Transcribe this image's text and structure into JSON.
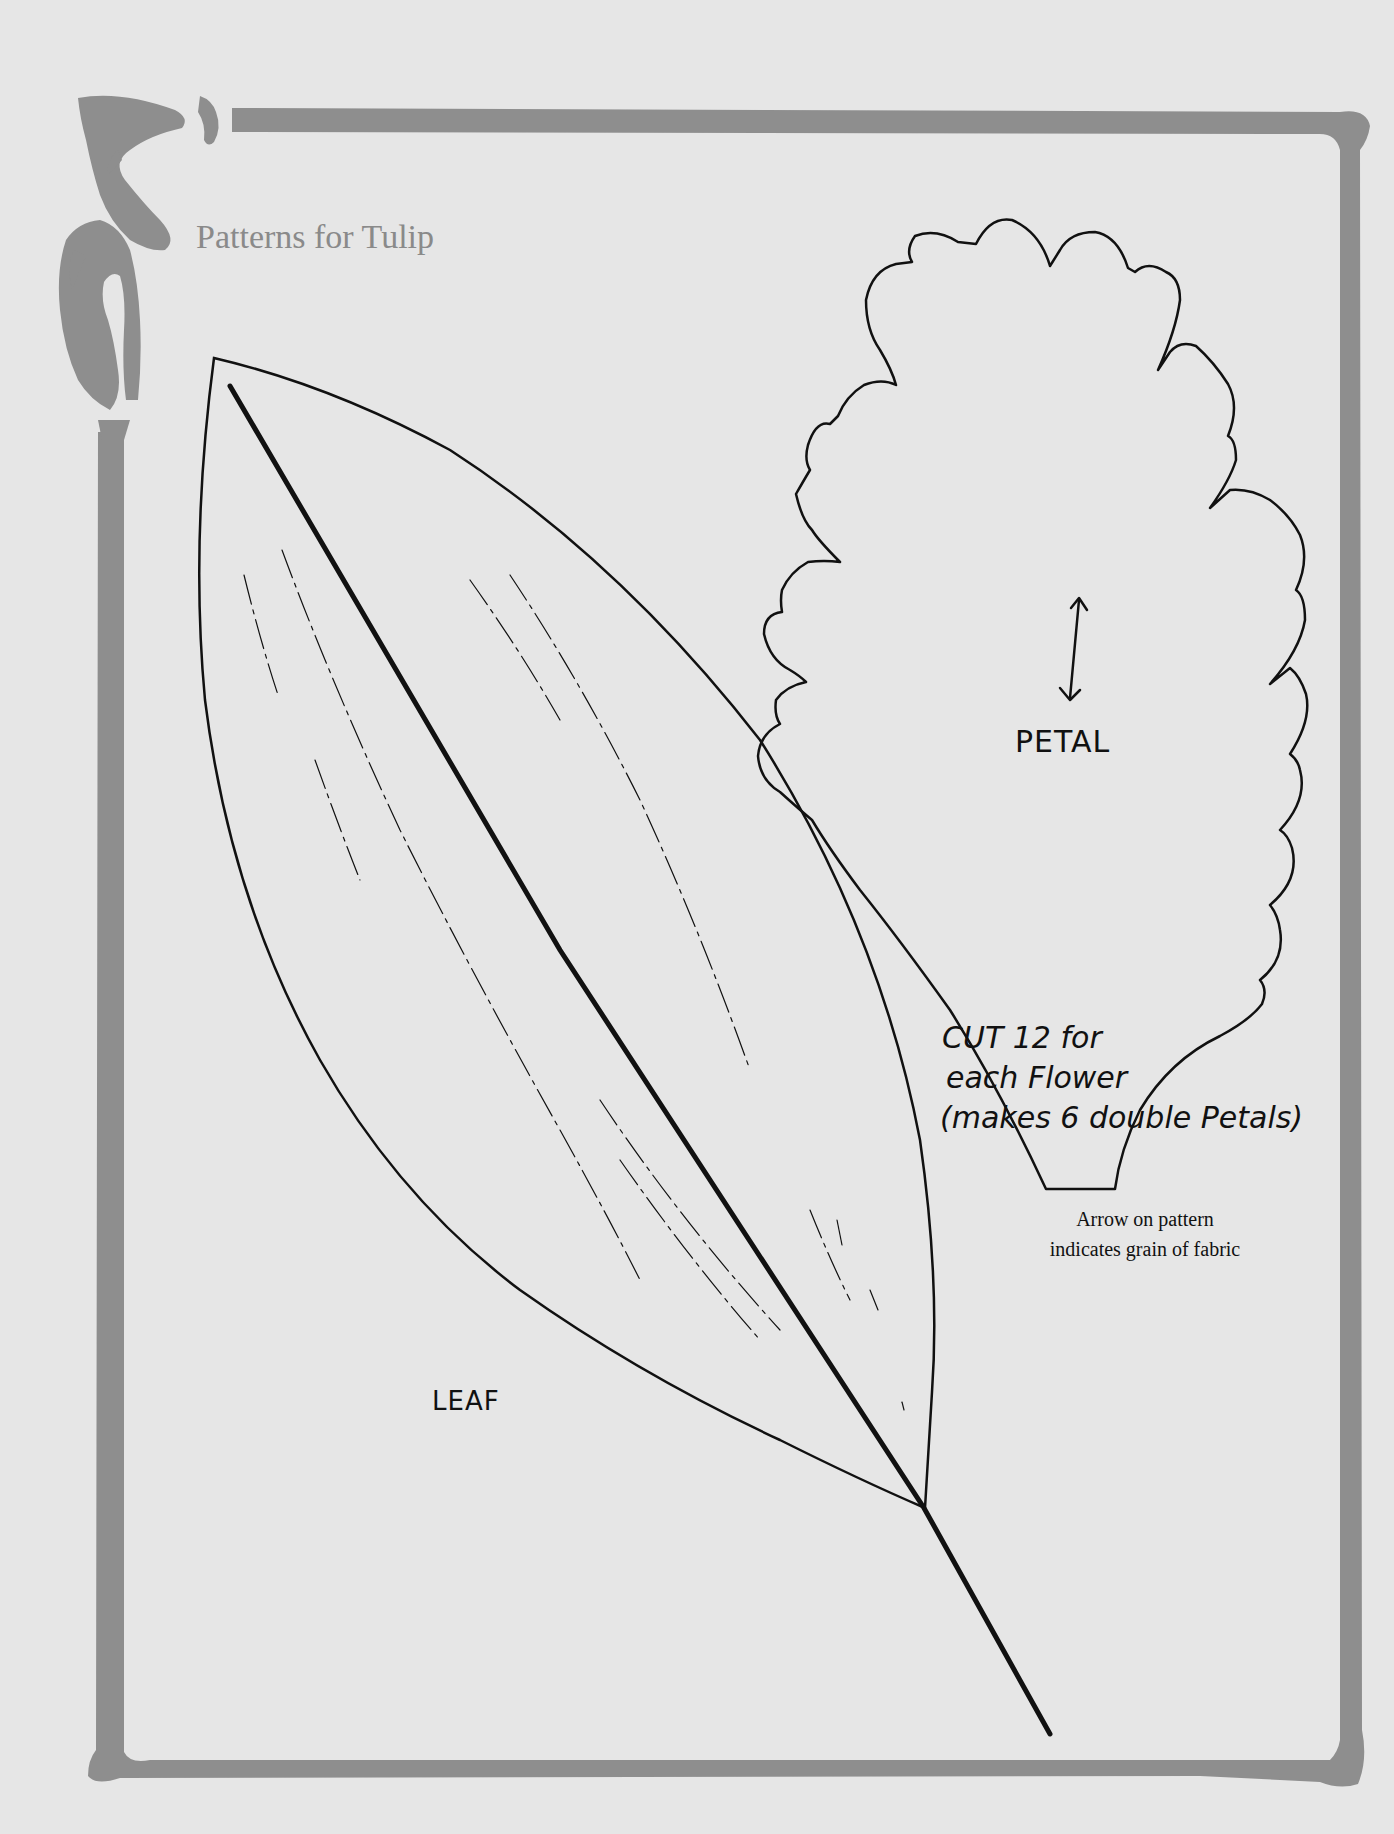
{
  "page": {
    "title": "Patterns for Tulip",
    "background_color": "#e6e6e6",
    "frame_color": "#8e8e8e",
    "ink_color": "#111111"
  },
  "patterns": {
    "petal": {
      "label": "PETAL",
      "grain_arrow": "double-headed-arrow"
    },
    "leaf": {
      "label": "LEAF"
    }
  },
  "notes": {
    "cut_instructions": [
      "CUT 12 for",
      "each Flower",
      "(makes 6 double Petals)"
    ],
    "grain_note": [
      "Arrow on pattern",
      "indicates grain of fabric"
    ]
  }
}
